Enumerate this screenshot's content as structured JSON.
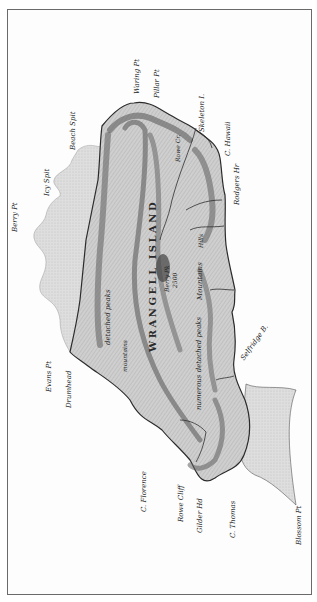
{
  "map": {
    "title": "WRANGELL ISLAND",
    "summit": {
      "name": "Berry Pk",
      "elevation": "2500"
    },
    "colors": {
      "land": "#c9c9c9",
      "shoal": "#dcdcdc",
      "mountain": "#6e6e6e",
      "coast": "#2b2b2b",
      "frame": "#6a6a6a"
    },
    "labels": {
      "waring_pt": "Waring Pt",
      "pillar_pt": "Pillar Pt",
      "skeleton_i": "Skeleton I.",
      "c_hawaii": "C. Hawaii",
      "beach_spit": "Beach Spit",
      "icy_spit": "Icy Spit",
      "berry_pt": "Berry Pt",
      "rodgers_hr": "Rodgers Hr",
      "selfridge_b": "Selfridge B.",
      "evans_pt": "Evans Pt",
      "drumhead": "Drumhead",
      "c_florence": "C. Florence",
      "rowe_cliff": "Rowe Cliff",
      "gilder_hd": "Gilder Hd",
      "c_thomas": "C. Thomas",
      "blossom_pt": "Blossom Pt",
      "rowe_cr": "Rowe Cr.",
      "detached_peaks_1": "detached peaks",
      "detached_peaks_2": "numerous detached peaks",
      "mountain_ridge": "mountains",
      "hills": "Hills",
      "mountains_right": "Mountains"
    }
  }
}
